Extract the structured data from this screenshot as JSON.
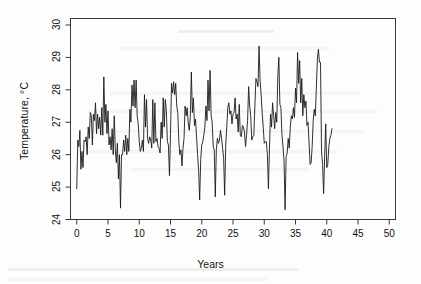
{
  "figure": {
    "background_color": "#fdfdfc",
    "line_color": "#1a1a1a",
    "axis_color": "#333333"
  },
  "chart_data": {
    "type": "line",
    "title": "",
    "subtitle": "",
    "xlabel": "Years",
    "ylabel": "Temperature, °C",
    "xlim": [
      -1.0,
      51.0
    ],
    "ylim": [
      24.0,
      30.2
    ],
    "xticks": [
      0,
      5,
      10,
      15,
      20,
      25,
      30,
      35,
      40,
      45,
      50
    ],
    "yticks": [
      24,
      25,
      26,
      27,
      28,
      29,
      30
    ],
    "xtick_labels": [
      "0",
      "5",
      "10",
      "15",
      "20",
      "25",
      "30",
      "35",
      "40",
      "45",
      "50"
    ],
    "ytick_labels": [
      "24",
      "25",
      "26",
      "27",
      "28",
      "29",
      "30"
    ],
    "grid": false,
    "legend": null,
    "legend_position": "none",
    "series": [
      {
        "name": "Temperature",
        "x_start": 0.0,
        "x_step": 0.16666667,
        "units": "°C",
        "values": [
          24.95,
          26.45,
          26.25,
          26.75,
          25.55,
          26.1,
          25.6,
          26.45,
          26.4,
          26.55,
          26.0,
          26.85,
          26.5,
          27.3,
          27.2,
          26.3,
          27.25,
          27.05,
          27.6,
          26.65,
          27.25,
          26.8,
          27.15,
          26.6,
          27.45,
          26.6,
          28.4,
          27.0,
          27.55,
          26.65,
          27.35,
          26.3,
          26.55,
          26.15,
          26.8,
          26.0,
          27.2,
          26.15,
          25.75,
          26.35,
          25.25,
          26.0,
          24.35,
          26.0,
          26.0,
          26.45,
          26.1,
          26.6,
          26.0,
          26.5,
          26.1,
          27.4,
          27.0,
          28.15,
          27.5,
          28.3,
          27.45,
          28.3,
          27.2,
          26.95,
          26.4,
          26.1,
          26.2,
          26.45,
          26.1,
          27.85,
          26.85,
          27.7,
          26.5,
          26.35,
          26.55,
          26.45,
          26.2,
          27.7,
          26.35,
          27.6,
          26.4,
          26.5,
          26.25,
          26.2,
          26.05,
          27.0,
          26.5,
          27.75,
          26.85,
          27.7,
          27.35,
          26.4,
          26.3,
          25.35,
          26.65,
          28.2,
          27.9,
          28.25,
          27.85,
          28.2,
          27.5,
          27.3,
          26.4,
          26.0,
          26.15,
          25.65,
          26.2,
          26.5,
          27.5,
          27.2,
          27.45,
          27.0,
          26.75,
          27.15,
          28.55,
          27.3,
          27.75,
          26.9,
          27.1,
          26.55,
          26.0,
          25.5,
          24.6,
          25.85,
          26.3,
          26.4,
          26.6,
          26.85,
          27.5,
          27.05,
          28.3,
          27.35,
          28.6,
          27.2,
          27.0,
          26.25,
          26.15,
          24.7,
          26.15,
          26.5,
          26.35,
          26.45,
          26.75,
          26.5,
          26.2,
          25.9,
          24.75,
          26.3,
          26.85,
          27.45,
          27.6,
          27.25,
          27.35,
          26.95,
          27.25,
          27.3,
          27.75,
          27.1,
          27.25,
          26.7,
          27.55,
          26.6,
          26.55,
          26.9,
          26.85,
          26.7,
          26.25,
          26.6,
          27.05,
          28.1,
          27.5,
          27.2,
          26.45,
          26.55,
          26.6,
          27.5,
          28.35,
          28.25,
          28.1,
          29.35,
          28.3,
          27.85,
          27.3,
          26.85,
          26.35,
          26.4,
          26.4,
          26.0,
          24.95,
          26.2,
          27.25,
          26.85,
          27.6,
          27.2,
          26.8,
          27.3,
          27.0,
          28.4,
          29.0,
          27.55,
          27.45,
          26.6,
          26.25,
          25.8,
          24.3,
          25.95,
          26.05,
          26.5,
          26.2,
          26.85,
          27.2,
          27.1,
          27.45,
          27.15,
          28.05,
          27.6,
          29.15,
          28.2,
          28.9,
          27.6,
          28.35,
          27.2,
          27.85,
          27.45,
          27.65,
          26.9,
          27.0,
          26.4,
          25.7,
          25.75,
          26.25,
          27.05,
          27.4,
          27.2,
          28.05,
          28.95,
          29.25,
          28.85,
          28.85,
          26.1,
          25.7,
          24.8,
          25.95,
          26.95,
          25.6,
          25.7,
          26.25,
          26.5,
          26.6,
          26.8
        ]
      }
    ]
  }
}
